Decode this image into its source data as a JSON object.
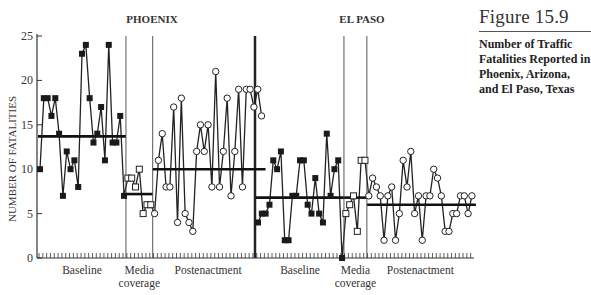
{
  "caption": {
    "figure_label": "Figure 15.9",
    "description": "Number of Traffic Fatalities Reported in Phoenix, Arizona, and El Paso, Texas"
  },
  "chart_data": {
    "type": "line",
    "title": "Number of Traffic Fatalities Reported in Phoenix, Arizona, and El Paso, Texas",
    "ylabel": "NUMBER OF FATALITIES",
    "xlabel": "",
    "ylim": [
      0,
      25
    ],
    "yticks": [
      0,
      5,
      10,
      15,
      20,
      25
    ],
    "grid": false,
    "legend": "none",
    "panels": [
      {
        "name": "PHOENIX",
        "phases": [
          {
            "label": "Baseline",
            "marker": "filled-square",
            "values": [
              10,
              18,
              18,
              16,
              18,
              14,
              7,
              12,
              10,
              11,
              8,
              23,
              24,
              18,
              13,
              14,
              17,
              11,
              24,
              13,
              13,
              16,
              7
            ],
            "mean": 13.7
          },
          {
            "label": "Media coverage",
            "marker": "open-square",
            "values": [
              9,
              9,
              8,
              10,
              5,
              6,
              6
            ],
            "mean": 7.2
          },
          {
            "label": "Postenactment",
            "marker": "open-circle",
            "values": [
              5,
              11,
              14,
              8,
              8,
              17,
              4,
              18,
              5,
              4,
              3,
              12,
              15,
              12,
              15,
              8,
              21,
              8,
              12,
              18,
              7,
              12,
              19,
              8,
              19,
              19,
              17,
              19,
              16
            ],
            "mean": 10
          }
        ]
      },
      {
        "name": "EL PASO",
        "phases": [
          {
            "label": "Baseline",
            "marker": "filled-square",
            "values": [
              4,
              5,
              5,
              6,
              11,
              10,
              12,
              2,
              2,
              7,
              7,
              11,
              11,
              6,
              5,
              9,
              5,
              4,
              14,
              7,
              10,
              11,
              0
            ],
            "mean": 6.8
          },
          {
            "label": "Media coverage",
            "marker": "open-square",
            "values": [
              5,
              6,
              7,
              3,
              11,
              11
            ],
            "mean": 6.8
          },
          {
            "label": "Postenactment",
            "marker": "open-circle",
            "values": [
              7,
              9,
              8,
              7,
              2,
              7,
              8,
              2,
              5,
              11,
              8,
              12,
              5,
              7,
              2,
              7,
              7,
              10,
              9,
              7,
              3,
              3,
              5,
              5,
              7,
              7,
              5,
              7
            ],
            "mean": 6
          }
        ]
      }
    ],
    "colors": {
      "line": "#222222",
      "axis": "#333333"
    }
  }
}
